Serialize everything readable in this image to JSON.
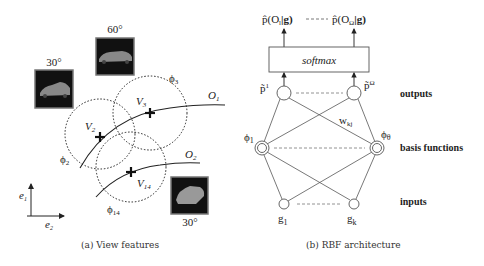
{
  "panel_a": {
    "caption": "(a) View features",
    "images": [
      {
        "angle": "30°"
      },
      {
        "angle": "60°"
      },
      {
        "angle": "30°"
      }
    ],
    "curves": {
      "o1": "O",
      "o1_sub": "1",
      "o2": "O",
      "o2_sub": "2"
    },
    "views": {
      "v2": "V",
      "v2_sub": "2",
      "v3": "V",
      "v3_sub": "3",
      "v14": "V",
      "v14_sub": "14"
    },
    "basis": {
      "phi2": "ϕ",
      "phi2_sub": "2",
      "phi3": "ϕ",
      "phi3_sub": "3",
      "phi14": "ϕ",
      "phi14_sub": "14"
    },
    "axes": {
      "e1": "e",
      "e1_sub": "1",
      "e2": "e",
      "e2_sub": "2"
    }
  },
  "panel_b": {
    "caption": "(b) RBF architecture",
    "top_outputs": {
      "left": "p̂(O",
      "left_sub": "l",
      "left_end": "|g)",
      "dashes": "- - - -",
      "right": "p̂(O",
      "right_sub": "Ω",
      "right_end": "|g)"
    },
    "softmax_label": "softmax",
    "output_nodes": {
      "left": "p̃",
      "left_sup": "1",
      "right": "p̃",
      "right_sup": "Ω"
    },
    "weight_label": "w",
    "weight_sub": "kj",
    "basis_nodes": {
      "left": "ϕ",
      "left_sub": "1",
      "right": "ϕ",
      "right_sub": "θ"
    },
    "input_nodes": {
      "left": "g",
      "left_sub": "1",
      "right": "g",
      "right_sub": "k"
    },
    "layer_labels": {
      "outputs": "outputs",
      "basis": "basis functions",
      "inputs": "inputs"
    }
  }
}
